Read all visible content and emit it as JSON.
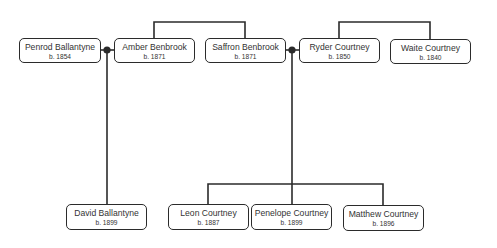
{
  "diagram": {
    "type": "family-tree",
    "line_color": "#2b2b2b",
    "box_border_color": "#2b2b2b",
    "text_color": "#333333",
    "people": [
      {
        "id": "penrod",
        "name": "Penrod Ballantyne",
        "born": "b. 1854",
        "x": 19,
        "y": 38,
        "w": 82,
        "h": 25
      },
      {
        "id": "amber",
        "name": "Amber Benbrook",
        "born": "b. 1871",
        "x": 114,
        "y": 38,
        "w": 81,
        "h": 25
      },
      {
        "id": "saffron",
        "name": "Saffron Benbrook",
        "born": "b. 1871",
        "x": 205,
        "y": 38,
        "w": 81,
        "h": 25
      },
      {
        "id": "ryder",
        "name": "Ryder Courtney",
        "born": "b. 1850",
        "x": 299,
        "y": 38,
        "w": 81,
        "h": 25
      },
      {
        "id": "waite",
        "name": "Waite Courtney",
        "born": "b. 1840",
        "x": 390,
        "y": 39,
        "w": 81,
        "h": 25
      },
      {
        "id": "david",
        "name": "David Ballantyne",
        "born": "b. 1899",
        "x": 66,
        "y": 204,
        "w": 81,
        "h": 26
      },
      {
        "id": "leon",
        "name": "Leon Courtney",
        "born": "b. 1887",
        "x": 168,
        "y": 204,
        "w": 81,
        "h": 26
      },
      {
        "id": "penelope",
        "name": "Penelope Courtney",
        "born": "b. 1899",
        "x": 251,
        "y": 204,
        "w": 81,
        "h": 26
      },
      {
        "id": "matthew",
        "name": "Matthew Courtney",
        "born": "b. 1896",
        "x": 343,
        "y": 205,
        "w": 81,
        "h": 26
      }
    ],
    "relationships": {
      "siblings": [
        {
          "members": [
            "amber",
            "saffron"
          ]
        },
        {
          "members": [
            "ryder",
            "waite"
          ]
        }
      ],
      "marriages": [
        {
          "partners": [
            "penrod",
            "amber"
          ],
          "children": [
            "david"
          ]
        },
        {
          "partners": [
            "saffron",
            "ryder"
          ],
          "children": [
            "leon",
            "penelope",
            "matthew"
          ]
        }
      ]
    }
  }
}
